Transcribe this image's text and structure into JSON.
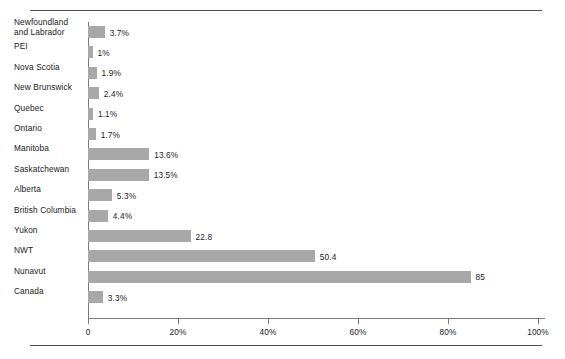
{
  "chart_data": {
    "type": "bar",
    "orientation": "horizontal",
    "title": "",
    "xlabel": "",
    "ylabel": "",
    "xlim": [
      0,
      100
    ],
    "grid": false,
    "legend": null,
    "xticks": [
      {
        "value": 0,
        "label": "0"
      },
      {
        "value": 20,
        "label": "20%"
      },
      {
        "value": 40,
        "label": "40%"
      },
      {
        "value": 60,
        "label": "60%"
      },
      {
        "value": 80,
        "label": "80%"
      },
      {
        "value": 100,
        "label": "100%"
      }
    ],
    "categories": [
      "Newfoundland and Labrador",
      "PEI",
      "Nova Scotia",
      "New Brunswick",
      "Quebec",
      "Ontario",
      "Manitoba",
      "Saskatchewan",
      "Alberta",
      "British Columbia",
      "Yukon",
      "NWT",
      "Nunavut",
      "Canada"
    ],
    "values": [
      3.7,
      1,
      1.9,
      2.4,
      1.1,
      1.7,
      13.6,
      13.5,
      5.3,
      4.4,
      22.8,
      50.4,
      85,
      3.3
    ],
    "data_labels": [
      "3.7%",
      "1%",
      "1.9%",
      "2.4%",
      "1.1%",
      "1.7%",
      "13.6%",
      "13.5%",
      "5.3%",
      "4.4%",
      "22.8",
      "50.4",
      "85",
      "3.3%"
    ],
    "bar_color": "#a8a8a8",
    "axis_color": "#7a7a7a",
    "rule_color": "#4d4d4d"
  },
  "rows": [
    {
      "label_line1": "Newfoundland",
      "label_line2": "and Labrador",
      "value": 3.7,
      "data_label": "3.7%"
    },
    {
      "label_line1": "PEI",
      "label_line2": "",
      "value": 1,
      "data_label": "1%"
    },
    {
      "label_line1": "Nova Scotia",
      "label_line2": "",
      "value": 1.9,
      "data_label": "1.9%"
    },
    {
      "label_line1": "New Brunswick",
      "label_line2": "",
      "value": 2.4,
      "data_label": "2.4%"
    },
    {
      "label_line1": "Quebec",
      "label_line2": "",
      "value": 1.1,
      "data_label": "1.1%"
    },
    {
      "label_line1": "Ontario",
      "label_line2": "",
      "value": 1.7,
      "data_label": "1.7%"
    },
    {
      "label_line1": "Manitoba",
      "label_line2": "",
      "value": 13.6,
      "data_label": "13.6%"
    },
    {
      "label_line1": "Saskatchewan",
      "label_line2": "",
      "value": 13.5,
      "data_label": "13.5%"
    },
    {
      "label_line1": "Alberta",
      "label_line2": "",
      "value": 5.3,
      "data_label": "5.3%"
    },
    {
      "label_line1": "British Columbia",
      "label_line2": "",
      "value": 4.4,
      "data_label": "4.4%"
    },
    {
      "label_line1": "Yukon",
      "label_line2": "",
      "value": 22.8,
      "data_label": "22.8"
    },
    {
      "label_line1": "NWT",
      "label_line2": "",
      "value": 50.4,
      "data_label": "50.4"
    },
    {
      "label_line1": "Nunavut",
      "label_line2": "",
      "value": 85,
      "data_label": "85"
    },
    {
      "label_line1": "Canada",
      "label_line2": "",
      "value": 3.3,
      "data_label": "3.3%"
    }
  ]
}
